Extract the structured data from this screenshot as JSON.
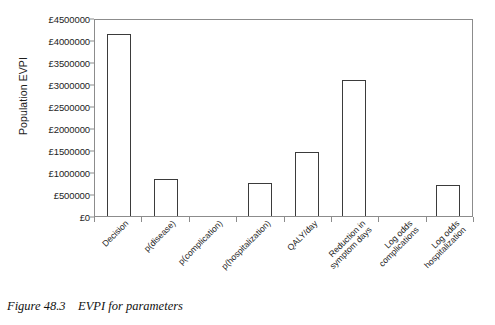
{
  "caption": "Figure 48.3    EVPI for parameters",
  "chart_data": {
    "type": "bar",
    "title": "",
    "xlabel": "",
    "ylabel": "Population EVPI",
    "ylim": [
      0,
      4500000
    ],
    "ytick_step": 500000,
    "grid": false,
    "legend": "none",
    "currency_symbol": "£",
    "categories": [
      "Decision",
      "p(disease)",
      "p(complication)",
      "p(hospitalization)",
      "QALY/day",
      "Reduction in\nsymptom days",
      "Log odds\ncomplications",
      "Log odds\nhospitalization"
    ],
    "values": [
      4130000,
      850000,
      0,
      750000,
      1460000,
      3080000,
      0,
      710000
    ],
    "ytick_labels": [
      "£0",
      "£500000",
      "£1000000",
      "£1500000",
      "£2000000",
      "£2500000",
      "£3000000",
      "£3500000",
      "£4000000",
      "£4500000"
    ],
    "ytick_values": [
      0,
      500000,
      1000000,
      1500000,
      2000000,
      2500000,
      3000000,
      3500000,
      4000000,
      4500000
    ],
    "bar_face_color": "#ffffff",
    "bar_edge_color": "#3b3b3b",
    "axis_color": "#8c8c8c"
  }
}
